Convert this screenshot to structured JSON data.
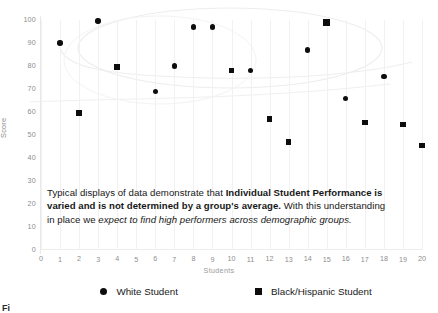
{
  "chart_data": {
    "type": "scatter",
    "title": "",
    "xlabel": "Students",
    "ylabel": "Score",
    "xlim": [
      0,
      20
    ],
    "ylim": [
      0,
      100
    ],
    "xticks": [
      "0",
      "1",
      "2",
      "3",
      "4",
      "5",
      "6",
      "7",
      "8",
      "9",
      "10",
      "11",
      "12",
      "13",
      "14",
      "15",
      "16",
      "17",
      "18",
      "19",
      "20"
    ],
    "yticks": [
      "0",
      "10",
      "20",
      "30",
      "40",
      "50",
      "60",
      "70",
      "80",
      "90",
      "100"
    ],
    "grid": "vertical-faint",
    "legend_position": "bottom",
    "series": [
      {
        "name": "White Student",
        "marker": "circle",
        "color": "#0d0d0d",
        "points": [
          {
            "x": 1,
            "y": 90
          },
          {
            "x": 3,
            "y": 99.5
          },
          {
            "x": 6,
            "y": 69
          },
          {
            "x": 7,
            "y": 80
          },
          {
            "x": 8,
            "y": 97
          },
          {
            "x": 9,
            "y": 97
          },
          {
            "x": 11,
            "y": 78
          },
          {
            "x": 14,
            "y": 87
          },
          {
            "x": 15,
            "y": 98.5
          },
          {
            "x": 16,
            "y": 66
          },
          {
            "x": 18,
            "y": 75.5
          }
        ]
      },
      {
        "name": "Black/Hispanic Student",
        "marker": "square",
        "color": "#0d0d0d",
        "points": [
          {
            "x": 2,
            "y": 59.5
          },
          {
            "x": 4,
            "y": 79.5
          },
          {
            "x": 10,
            "y": 78
          },
          {
            "x": 12,
            "y": 57
          },
          {
            "x": 13,
            "y": 47
          },
          {
            "x": 15,
            "y": 99
          },
          {
            "x": 17,
            "y": 55.5
          },
          {
            "x": 19,
            "y": 54.5
          },
          {
            "x": 20,
            "y": 45.5
          }
        ]
      }
    ]
  },
  "annotation": {
    "line1_plain_a": "Typical displays of data demonstrate that ",
    "line1_bold": "Individual Student",
    "line2_bold": "Performance is varied and is not determined by a group's average.",
    "line2_plain": " With",
    "line3_plain": "this understanding in place we ",
    "line3_italic": "expect to find high performers across",
    "line4_italic": "demographic groups."
  },
  "legend": {
    "white_student": "White Student",
    "black_hispanic_student": "Black/Hispanic Student"
  },
  "caption": {
    "text": "Fi"
  },
  "colors": {
    "marker": "#0d0d0d",
    "tick_text": "#8d8d8d",
    "grid": "#f1f1f1",
    "body_text": "#171717"
  }
}
